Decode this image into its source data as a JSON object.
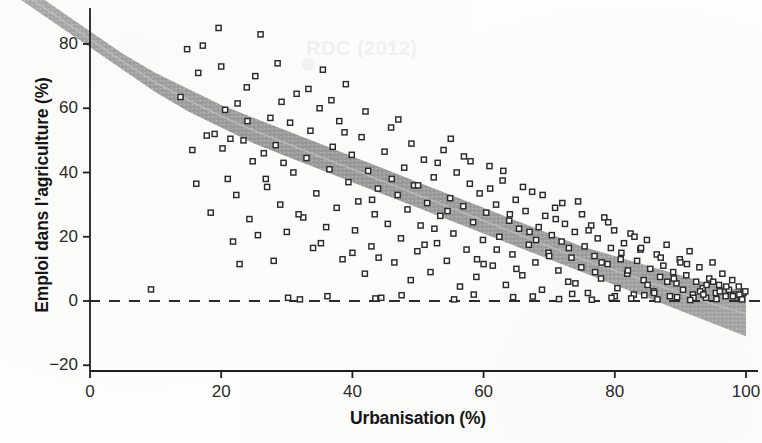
{
  "chart_data": {
    "type": "scatter",
    "title": "",
    "xlabel": "Urbanisation (%)",
    "ylabel": "Emploi dans l’agriculture (%)",
    "xlim": [
      0,
      100
    ],
    "ylim": [
      -25,
      90
    ],
    "xticks": [
      0,
      20,
      40,
      60,
      80,
      100
    ],
    "xtick_labels": [
      "0",
      "20",
      "40",
      "60",
      "80",
      "100"
    ],
    "yticks": [
      -20,
      0,
      20,
      40,
      60,
      80
    ],
    "ytick_labels": [
      "−20",
      "0",
      "20",
      "40",
      "60",
      "80"
    ],
    "grid": false,
    "legend": null,
    "marker": "open-square",
    "marker_color": "#2b2b2b",
    "band_color": "#9a9a9a",
    "reference_line": {
      "y": 0,
      "style": "dashed",
      "color": "#2b2b2b"
    },
    "annotations": [
      {
        "text": "RDC (2012)",
        "x": 33,
        "y": 81,
        "color": "#f1f1f1"
      }
    ],
    "fit_band": {
      "label": "loess confidence band",
      "x": [
        0,
        5,
        10,
        15,
        20,
        25,
        30,
        35,
        40,
        45,
        50,
        55,
        60,
        65,
        70,
        75,
        80,
        85,
        90,
        95,
        100
      ],
      "upper": [
        84,
        77,
        71,
        66,
        61,
        57,
        53,
        49,
        45,
        41,
        37,
        33,
        29,
        25,
        21,
        17,
        14,
        11,
        8,
        5,
        3
      ],
      "lower": [
        79,
        72,
        65,
        59,
        54,
        49,
        45,
        41,
        37,
        33,
        29,
        25,
        21,
        17,
        13,
        9,
        5,
        1,
        -3,
        -7,
        -11
      ],
      "center": [
        81.5,
        74.5,
        68,
        62.5,
        57.5,
        53,
        49,
        45,
        41,
        37,
        33,
        29,
        25,
        21,
        17,
        13,
        9.5,
        6,
        2.5,
        -1,
        -4
      ]
    },
    "points": [
      [
        9.3,
        3.6
      ],
      [
        13.8,
        63.5
      ],
      [
        14.8,
        78.4
      ],
      [
        15.6,
        47.0
      ],
      [
        16.2,
        36.5
      ],
      [
        16.5,
        71.0
      ],
      [
        17.2,
        79.5
      ],
      [
        17.8,
        51.5
      ],
      [
        18.4,
        27.5
      ],
      [
        19.0,
        52.0
      ],
      [
        19.6,
        85.0
      ],
      [
        20.2,
        47.5
      ],
      [
        20.6,
        59.5
      ],
      [
        21.0,
        38.0
      ],
      [
        21.4,
        50.5
      ],
      [
        21.8,
        18.5
      ],
      [
        22.3,
        33.0
      ],
      [
        22.8,
        11.5
      ],
      [
        23.4,
        50.0
      ],
      [
        23.9,
        66.5
      ],
      [
        24.3,
        25.5
      ],
      [
        24.8,
        43.5
      ],
      [
        25.2,
        70.0
      ],
      [
        25.6,
        20.5
      ],
      [
        26.0,
        83.0
      ],
      [
        26.5,
        46.0
      ],
      [
        27.0,
        35.5
      ],
      [
        27.5,
        57.0
      ],
      [
        28.0,
        12.5
      ],
      [
        28.6,
        74.0
      ],
      [
        29.0,
        30.0
      ],
      [
        29.5,
        43.0
      ],
      [
        30.0,
        21.5
      ],
      [
        30.5,
        55.5
      ],
      [
        31.0,
        40.0
      ],
      [
        31.5,
        64.5
      ],
      [
        32.0,
        0.5
      ],
      [
        32.5,
        26.0
      ],
      [
        33.0,
        44.5
      ],
      [
        33.6,
        53.0
      ],
      [
        34.0,
        16.5
      ],
      [
        34.5,
        33.5
      ],
      [
        35.0,
        60.0
      ],
      [
        35.5,
        72.0
      ],
      [
        36.0,
        23.0
      ],
      [
        36.5,
        41.0
      ],
      [
        37.0,
        48.0
      ],
      [
        37.6,
        29.0
      ],
      [
        38.0,
        56.0
      ],
      [
        38.5,
        13.0
      ],
      [
        39.0,
        67.5
      ],
      [
        39.4,
        37.0
      ],
      [
        39.9,
        45.5
      ],
      [
        40.4,
        22.0
      ],
      [
        40.9,
        31.0
      ],
      [
        41.4,
        51.0
      ],
      [
        41.9,
        8.5
      ],
      [
        42.4,
        40.5
      ],
      [
        42.9,
        17.0
      ],
      [
        43.4,
        27.0
      ],
      [
        43.9,
        35.0
      ],
      [
        44.4,
        1.0
      ],
      [
        44.9,
        46.5
      ],
      [
        45.4,
        24.0
      ],
      [
        45.9,
        54.0
      ],
      [
        46.4,
        12.0
      ],
      [
        46.9,
        33.0
      ],
      [
        47.4,
        19.5
      ],
      [
        47.9,
        41.5
      ],
      [
        48.4,
        28.5
      ],
      [
        48.9,
        6.5
      ],
      [
        49.4,
        36.0
      ],
      [
        49.9,
        15.5
      ],
      [
        50.4,
        23.5
      ],
      [
        50.9,
        44.0
      ],
      [
        51.4,
        30.5
      ],
      [
        51.9,
        9.0
      ],
      [
        52.4,
        38.5
      ],
      [
        52.9,
        18.0
      ],
      [
        53.4,
        26.5
      ],
      [
        53.9,
        47.0
      ],
      [
        54.4,
        12.5
      ],
      [
        54.9,
        32.0
      ],
      [
        55.4,
        21.0
      ],
      [
        55.9,
        40.0
      ],
      [
        56.4,
        4.5
      ],
      [
        56.9,
        29.5
      ],
      [
        57.4,
        16.0
      ],
      [
        57.9,
        36.5
      ],
      [
        58.4,
        24.5
      ],
      [
        58.9,
        7.5
      ],
      [
        59.4,
        33.5
      ],
      [
        59.9,
        19.0
      ],
      [
        60.4,
        27.5
      ],
      [
        60.9,
        42.0
      ],
      [
        61.4,
        11.0
      ],
      [
        61.9,
        30.0
      ],
      [
        62.4,
        20.0
      ],
      [
        62.9,
        37.5
      ],
      [
        63.4,
        5.0
      ],
      [
        63.9,
        25.0
      ],
      [
        64.4,
        14.5
      ],
      [
        64.9,
        31.5
      ],
      [
        65.4,
        22.5
      ],
      [
        65.9,
        8.0
      ],
      [
        66.4,
        28.0
      ],
      [
        66.9,
        17.5
      ],
      [
        67.4,
        34.0
      ],
      [
        67.9,
        12.0
      ],
      [
        68.4,
        23.0
      ],
      [
        68.9,
        3.5
      ],
      [
        69.4,
        26.5
      ],
      [
        69.9,
        15.0
      ],
      [
        70.4,
        20.5
      ],
      [
        70.9,
        29.0
      ],
      [
        71.4,
        9.5
      ],
      [
        71.9,
        18.5
      ],
      [
        72.4,
        24.0
      ],
      [
        72.9,
        6.0
      ],
      [
        73.4,
        13.5
      ],
      [
        73.9,
        21.5
      ],
      [
        74.4,
        31.0
      ],
      [
        74.9,
        10.5
      ],
      [
        75.4,
        17.0
      ],
      [
        75.9,
        2.5
      ],
      [
        76.4,
        23.5
      ],
      [
        76.9,
        14.0
      ],
      [
        77.4,
        19.5
      ],
      [
        77.9,
        7.0
      ],
      [
        78.4,
        26.0
      ],
      [
        78.9,
        11.5
      ],
      [
        79.4,
        16.5
      ],
      [
        79.9,
        22.0
      ],
      [
        80.4,
        4.0
      ],
      [
        80.9,
        13.0
      ],
      [
        81.4,
        18.0
      ],
      [
        81.9,
        8.5
      ],
      [
        82.4,
        21.0
      ],
      [
        82.9,
        2.0
      ],
      [
        83.4,
        12.5
      ],
      [
        83.9,
        16.0
      ],
      [
        84.4,
        6.5
      ],
      [
        84.9,
        19.0
      ],
      [
        85.4,
        10.0
      ],
      [
        85.9,
        3.0
      ],
      [
        86.4,
        14.5
      ],
      [
        86.9,
        7.5
      ],
      [
        87.4,
        11.0
      ],
      [
        87.9,
        17.5
      ],
      [
        88.4,
        1.5
      ],
      [
        88.9,
        9.0
      ],
      [
        89.4,
        5.5
      ],
      [
        89.9,
        13.0
      ],
      [
        90.4,
        3.5
      ],
      [
        90.9,
        8.0
      ],
      [
        91.4,
        15.5
      ],
      [
        91.9,
        2.0
      ],
      [
        92.4,
        6.0
      ],
      [
        92.9,
        10.5
      ],
      [
        93.4,
        4.0
      ],
      [
        93.9,
        1.0
      ],
      [
        94.4,
        7.0
      ],
      [
        94.9,
        12.0
      ],
      [
        95.4,
        2.5
      ],
      [
        95.9,
        5.0
      ],
      [
        96.4,
        8.5
      ],
      [
        96.9,
        1.5
      ],
      [
        97.4,
        3.5
      ],
      [
        97.9,
        6.5
      ],
      [
        98.4,
        2.0
      ],
      [
        98.9,
        4.5
      ],
      [
        99.2,
        1.0
      ],
      [
        99.6,
        2.5
      ],
      [
        99.9,
        3.0
      ],
      [
        29.2,
        62.0
      ],
      [
        31.8,
        27.0
      ],
      [
        35.2,
        18.0
      ],
      [
        38.8,
        52.5
      ],
      [
        42.0,
        59.0
      ],
      [
        44.0,
        13.5
      ],
      [
        47.0,
        56.5
      ],
      [
        49.0,
        49.0
      ],
      [
        51.0,
        17.5
      ],
      [
        53.0,
        43.0
      ],
      [
        55.0,
        50.5
      ],
      [
        57.0,
        45.0
      ],
      [
        59.0,
        13.0
      ],
      [
        61.0,
        35.0
      ],
      [
        63.0,
        40.5
      ],
      [
        65.0,
        10.0
      ],
      [
        67.0,
        21.5
      ],
      [
        69.0,
        33.0
      ],
      [
        71.0,
        25.5
      ],
      [
        73.0,
        16.5
      ],
      [
        75.0,
        27.0
      ],
      [
        77.0,
        9.0
      ],
      [
        79.0,
        24.5
      ],
      [
        81.0,
        15.0
      ],
      [
        83.0,
        20.0
      ],
      [
        85.0,
        5.0
      ],
      [
        87.0,
        13.5
      ],
      [
        89.0,
        7.0
      ],
      [
        91.0,
        11.5
      ],
      [
        93.0,
        3.0
      ],
      [
        95.0,
        6.0
      ],
      [
        97.0,
        4.5
      ],
      [
        99.0,
        2.0
      ],
      [
        20.0,
        73.0
      ],
      [
        22.5,
        61.5
      ],
      [
        24.0,
        56.0
      ],
      [
        26.8,
        38.0
      ],
      [
        28.3,
        48.5
      ],
      [
        33.3,
        66.0
      ],
      [
        36.8,
        62.5
      ],
      [
        40.0,
        15.0
      ],
      [
        43.0,
        31.5
      ],
      [
        46.0,
        38.0
      ],
      [
        50.0,
        36.0
      ],
      [
        52.5,
        22.5
      ],
      [
        54.5,
        28.0
      ],
      [
        58.0,
        43.5
      ],
      [
        60.0,
        11.5
      ],
      [
        62.0,
        16.0
      ],
      [
        64.0,
        27.0
      ],
      [
        66.0,
        35.5
      ],
      [
        68.0,
        19.0
      ],
      [
        70.0,
        14.0
      ],
      [
        72.0,
        30.5
      ],
      [
        74.0,
        5.5
      ],
      [
        76.0,
        22.0
      ],
      [
        78.0,
        12.0
      ],
      [
        80.0,
        1.5
      ],
      [
        82.0,
        9.5
      ],
      [
        84.0,
        16.5
      ],
      [
        86.0,
        2.5
      ],
      [
        88.0,
        6.0
      ],
      [
        90.0,
        12.0
      ],
      [
        92.0,
        1.0
      ],
      [
        94.0,
        5.0
      ],
      [
        96.0,
        3.0
      ],
      [
        98.0,
        1.5
      ],
      [
        43.5,
        0.8
      ],
      [
        55.5,
        0.5
      ],
      [
        64.5,
        1.2
      ],
      [
        71.5,
        0.6
      ],
      [
        76.5,
        0.4
      ],
      [
        82.5,
        0.8
      ],
      [
        86.5,
        0.5
      ],
      [
        91.5,
        0.3
      ],
      [
        95.5,
        0.6
      ],
      [
        99.4,
        0.5
      ],
      [
        30.2,
        1.0
      ],
      [
        36.2,
        1.5
      ],
      [
        47.5,
        1.8
      ],
      [
        58.5,
        2.0
      ],
      [
        67.5,
        1.4
      ],
      [
        73.5,
        2.2
      ],
      [
        79.5,
        1.0
      ],
      [
        84.5,
        1.8
      ],
      [
        89.5,
        1.2
      ],
      [
        93.5,
        2.0
      ]
    ]
  }
}
